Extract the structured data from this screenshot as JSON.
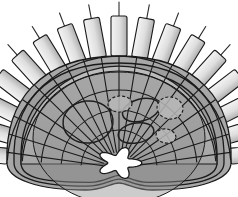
{
  "figure": {
    "title": "Radial cross-section anatomical diagram",
    "canvas": {
      "width": 238,
      "height": 197,
      "background": "#ffffff"
    }
  },
  "palette": {
    "background": "#ffffff",
    "outline": "#1a1a1a",
    "body_outer_band": "#a8a8a8",
    "body_mid_band": "#9a9a9a",
    "body_inner_fill": "#9f9f9f",
    "dome_fill": "#b4b4b4",
    "core_fill": "#8e8e8e",
    "lumen_fill": "#ffffff",
    "block_light": "#f2f2f2",
    "block_dark": "#b0b0b0",
    "stalk": "#2b2b2b",
    "ellipse_stroke": "#1f1f1f",
    "lobule_fill": "#b9b9b9"
  },
  "geometry": {
    "center": {
      "x": 119,
      "y": 168
    },
    "lumen": {
      "cx": 119,
      "cy": 163,
      "rx": 17,
      "ry": 12,
      "lobes": 5,
      "fill": "#ffffff",
      "label": "central-lumen"
    },
    "radial_septa": {
      "count": 19,
      "angle_start_deg": 188,
      "angle_end_deg": 352,
      "inner_radius": 16,
      "outer_radius": 118,
      "stroke_width": 1.1
    },
    "concentric_arcs": [
      {
        "radius": 38,
        "stroke_width": 1.0
      },
      {
        "radius": 58,
        "stroke_width": 1.0
      },
      {
        "radius": 78,
        "stroke_width": 1.1
      },
      {
        "radius": 97,
        "stroke_width": 1.2
      },
      {
        "radius": 112,
        "stroke_width": 1.3
      }
    ],
    "body_bands": [
      {
        "name": "outer-contour",
        "inset": 0,
        "fill": "#a8a8a8"
      },
      {
        "name": "second-contour",
        "inset": 7,
        "fill": "#9d9d9d"
      },
      {
        "name": "third-contour",
        "inset": 14,
        "fill": "#9a9a9a"
      }
    ],
    "dome_cap": {
      "radius": 112,
      "fill": "#b4b4b4"
    },
    "blocks": {
      "count": 17,
      "angle_start_deg": 186,
      "angle_end_deg": 354,
      "inner_radius": 112,
      "block_length": 40,
      "block_width": 16,
      "corner_radius": 2,
      "stalk_length": 14,
      "gradient_from": "#f4f4f4",
      "gradient_to": "#b0b0b0"
    },
    "internal_structures": [
      {
        "name": "left-large-oval",
        "cx": 88,
        "cy": 122,
        "rx": 25,
        "ry": 21,
        "rotation": -6
      },
      {
        "name": "right-upper-oval",
        "cx": 141,
        "cy": 110,
        "rx": 19,
        "ry": 11,
        "rotation": -16
      },
      {
        "name": "right-lower-oval",
        "cx": 136,
        "cy": 133,
        "rx": 18,
        "ry": 10,
        "rotation": -10
      },
      {
        "name": "lobule-upper-right",
        "cx": 170,
        "cy": 108,
        "rx": 13,
        "ry": 11,
        "rotation": 8
      },
      {
        "name": "lobule-lower-right",
        "cx": 166,
        "cy": 136,
        "rx": 10,
        "ry": 7,
        "rotation": 12
      },
      {
        "name": "lobule-center",
        "cx": 120,
        "cy": 104,
        "rx": 12,
        "ry": 8,
        "rotation": -4
      }
    ]
  }
}
